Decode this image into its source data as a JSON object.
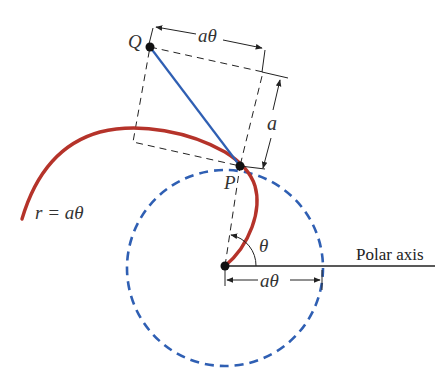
{
  "diagram": {
    "colors": {
      "curve": "#b5332a",
      "circle": "#2f5fb3",
      "segment": "#2f5fb3",
      "lines": "#222222"
    },
    "labels": {
      "point_q": "Q",
      "point_p": "P",
      "top_dimension": "aθ",
      "side_dimension": "a",
      "curve_equation": "r = aθ",
      "angle": "θ",
      "bottom_dimension": "aθ",
      "axis": "Polar axis"
    }
  }
}
